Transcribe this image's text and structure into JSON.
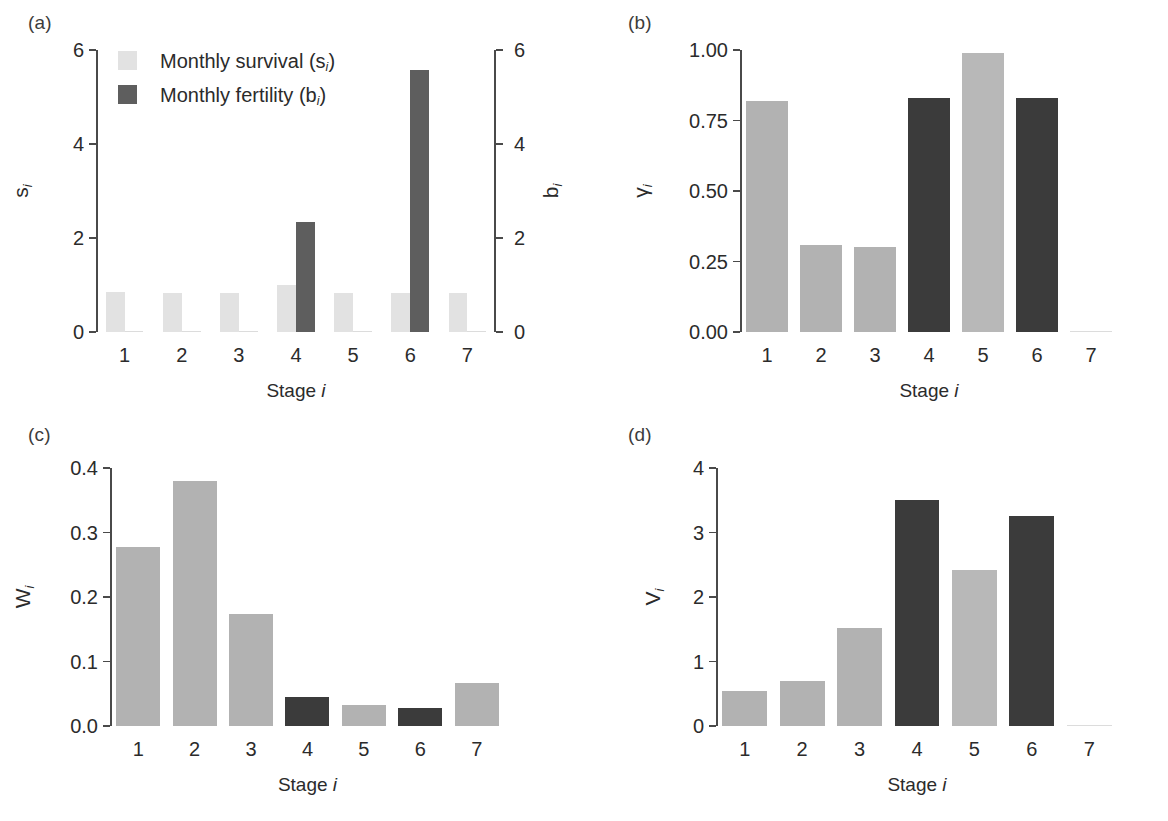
{
  "figure": {
    "colors": {
      "survival_light": "#e2e2e2",
      "bar_light": "#b2b2b2",
      "bar_dark": "#3b3b3b",
      "fertility_dark": "#5e5e5e",
      "axis": "#4a4a4a",
      "text": "#2b2b2b"
    },
    "xlabel": "Stage",
    "xlabel_italic": "i"
  },
  "chart_data": [
    {
      "panel": "(a)",
      "type": "bar",
      "title": "",
      "xlabel": "Stage i",
      "ylabel": "s",
      "ylabel_sub": "i",
      "ylabel_right": "b",
      "ylabel_right_sub": "i",
      "categories": [
        "1",
        "2",
        "3",
        "4",
        "5",
        "6",
        "7"
      ],
      "ylim": [
        0,
        6
      ],
      "yticks": [
        "0",
        "2",
        "4",
        "6"
      ],
      "ytick_values": [
        0,
        2,
        4,
        6
      ],
      "ylim_right": [
        0,
        6
      ],
      "yticks_right": [
        "0",
        "2",
        "4",
        "6"
      ],
      "ytick_values_right": [
        0,
        2,
        4,
        6
      ],
      "grid": false,
      "legend_position": "top-left",
      "series": [
        {
          "name": "Monthly survival (si)",
          "label_main": "Monthly survival (s",
          "label_sub": "i",
          "label_tail": ")",
          "color": "#e2e2e2",
          "values": [
            0.86,
            0.84,
            0.83,
            0.99,
            0.84,
            0.84,
            0.83
          ]
        },
        {
          "name": "Monthly fertility (bi)",
          "label_main": "Monthly fertility (b",
          "label_sub": "i",
          "label_tail": ")",
          "color": "#5e5e5e",
          "values": [
            0,
            0,
            0,
            2.35,
            0,
            5.58,
            0
          ]
        }
      ]
    },
    {
      "panel": "(b)",
      "type": "bar",
      "title": "",
      "xlabel": "Stage i",
      "ylabel": "γ",
      "ylabel_sub": "i",
      "categories": [
        "1",
        "2",
        "3",
        "4",
        "5",
        "6",
        "7"
      ],
      "ylim": [
        0,
        1.0
      ],
      "yticks": [
        "0.00",
        "0.25",
        "0.50",
        "0.75",
        "1.00"
      ],
      "ytick_values": [
        0,
        0.25,
        0.5,
        0.75,
        1.0
      ],
      "grid": false,
      "values": [
        0.82,
        0.31,
        0.3,
        0.83,
        0.99,
        0.83,
        0.0
      ],
      "bar_colors": [
        "#b2b2b2",
        "#b2b2b2",
        "#b2b2b2",
        "#3b3b3b",
        "#b8b8b8",
        "#3b3b3b",
        "#b2b2b2"
      ]
    },
    {
      "panel": "(c)",
      "type": "bar",
      "title": "",
      "xlabel": "Stage i",
      "ylabel": "W",
      "ylabel_sub": "i",
      "categories": [
        "1",
        "2",
        "3",
        "4",
        "5",
        "6",
        "7"
      ],
      "ylim": [
        0,
        0.4
      ],
      "yticks": [
        "0.0",
        "0.1",
        "0.2",
        "0.3",
        "0.4"
      ],
      "ytick_values": [
        0,
        0.1,
        0.2,
        0.3,
        0.4
      ],
      "grid": false,
      "values": [
        0.277,
        0.38,
        0.173,
        0.045,
        0.033,
        0.028,
        0.067
      ],
      "bar_colors": [
        "#b2b2b2",
        "#b2b2b2",
        "#b2b2b2",
        "#3b3b3b",
        "#b2b2b2",
        "#3b3b3b",
        "#b2b2b2"
      ]
    },
    {
      "panel": "(d)",
      "type": "bar",
      "title": "",
      "xlabel": "Stage i",
      "ylabel": "V",
      "ylabel_sub": "i",
      "categories": [
        "1",
        "2",
        "3",
        "4",
        "5",
        "6",
        "7"
      ],
      "ylim": [
        0,
        4
      ],
      "yticks": [
        "0",
        "1",
        "2",
        "3",
        "4"
      ],
      "ytick_values": [
        0,
        1,
        2,
        3,
        4
      ],
      "grid": false,
      "values": [
        0.55,
        0.7,
        1.52,
        3.5,
        2.42,
        3.26,
        0.0
      ],
      "bar_colors": [
        "#b2b2b2",
        "#b2b2b2",
        "#b2b2b2",
        "#3b3b3b",
        "#b8b8b8",
        "#3b3b3b",
        "#b2b2b2"
      ]
    }
  ]
}
